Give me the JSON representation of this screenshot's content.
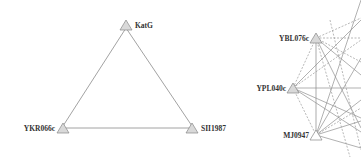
{
  "diagrams": [
    {
      "name": "triangle-network",
      "nodes": [
        {
          "id": "KatG",
          "label": "KatG",
          "x": 126,
          "y": 25,
          "label_side": "right"
        },
        {
          "id": "YKR066c",
          "label": "YKR066c",
          "x": 63,
          "y": 128,
          "label_side": "left"
        },
        {
          "id": "SII1987",
          "label": "SII1987",
          "x": 192,
          "y": 128,
          "label_side": "right"
        }
      ],
      "edges": [
        {
          "from": "KatG",
          "to": "YKR066c",
          "style": "solid"
        },
        {
          "from": "KatG",
          "to": "SII1987",
          "style": "solid"
        },
        {
          "from": "YKR066c",
          "to": "SII1987",
          "style": "solid"
        }
      ]
    },
    {
      "name": "dense-network",
      "nodes": [
        {
          "id": "YBL076c",
          "label": "YBL076c",
          "x": 316,
          "y": 38,
          "label_side": "left"
        },
        {
          "id": "YPL040c",
          "label": "YPL040c",
          "x": 293,
          "y": 88,
          "label_side": "left"
        },
        {
          "id": "MJ0947",
          "label": "MJ0947",
          "x": 316,
          "y": 135,
          "label_side": "left"
        }
      ]
    }
  ],
  "colors": {
    "node_fill": "#d9d9d9",
    "node_stroke": "#888888",
    "edge": "#888888",
    "dashed_edge": "#9a9a9a"
  }
}
